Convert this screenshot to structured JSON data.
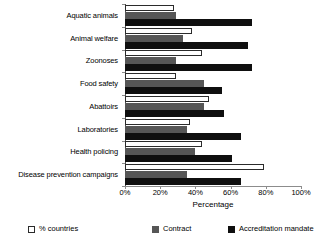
{
  "chart_data": {
    "type": "bar",
    "orientation": "horizontal",
    "title": "",
    "xlabel": "Percentage",
    "ylabel": "",
    "xlim": [
      0,
      100
    ],
    "xticks": [
      "0%",
      "20%",
      "40%",
      "60%",
      "80%",
      "100%"
    ],
    "xtick_values": [
      0,
      20,
      40,
      60,
      80,
      100
    ],
    "grid": false,
    "legend_position": "bottom",
    "categories": [
      "Aquatic animals",
      "Animal welfare",
      "Zoonoses",
      "Food safety",
      "Abattoirs",
      "Laboratories",
      "Health policing",
      "Disease prevention campaigns"
    ],
    "series": [
      {
        "name": "% countries",
        "color": "#ffffff",
        "values": [
          28,
          38,
          44,
          29,
          48,
          37,
          44,
          79
        ]
      },
      {
        "name": "Contract",
        "color": "#565656",
        "values": [
          29,
          33,
          29,
          45,
          45,
          35,
          40,
          35
        ]
      },
      {
        "name": "Accreditation mandate",
        "color": "#0f0f0f",
        "values": [
          72,
          70,
          72,
          55,
          56,
          66,
          61,
          66
        ]
      }
    ]
  }
}
